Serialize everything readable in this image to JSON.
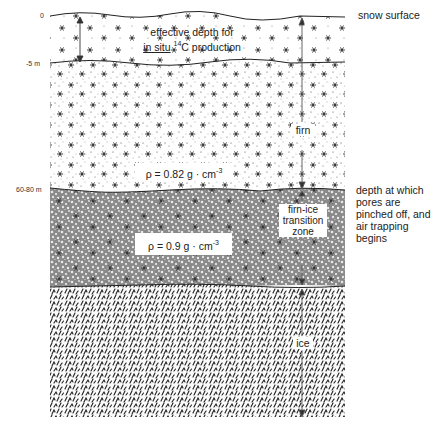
{
  "depth_labels": {
    "surface": "0",
    "snow_bottom": "-5 m",
    "transition_top": "60-80 m"
  },
  "layers": [
    {
      "id": "snow",
      "label": "",
      "pattern": "snowflakes"
    },
    {
      "id": "firn",
      "label": "firn",
      "pattern": "stippled-snowflakes"
    },
    {
      "id": "firn-ice",
      "label_lines": [
        "firn-ice",
        "transition",
        "zone"
      ],
      "pattern": "dense-stipple"
    },
    {
      "id": "ice",
      "label": "ice",
      "pattern": "ice-hatching"
    }
  ],
  "annotations": {
    "effective_depth_line1": "effective depth for",
    "effective_depth_insitu": "in situ",
    "effective_depth_isotope": "14",
    "effective_depth_rest": "C production",
    "density_firn_prefix": "ρ  = 0.82 g · cm",
    "density_firn_exp": "-3",
    "density_ice_prefix": "ρ  = 0.9  g · cm",
    "density_ice_exp": "-3"
  },
  "right_labels": {
    "snow_surface": "snow surface",
    "pore_closure": "depth at which pores are pinched off,  and air trapping begins"
  },
  "side_labels": {
    "firn": "firn",
    "transition_1": "firn-ice",
    "transition_2": "transition",
    "transition_3": "zone",
    "ice": "ice"
  },
  "colors": {
    "line": "#222222",
    "arrow": "#444444",
    "background": "#ffffff"
  }
}
